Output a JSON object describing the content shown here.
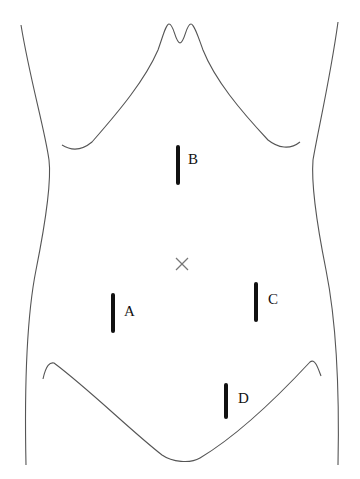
{
  "diagram": {
    "center_marker": "umbilicus-x",
    "incisions": [
      {
        "id": "A",
        "label": "A"
      },
      {
        "id": "B",
        "label": "B"
      },
      {
        "id": "C",
        "label": "C"
      },
      {
        "id": "D",
        "label": "D"
      }
    ]
  }
}
